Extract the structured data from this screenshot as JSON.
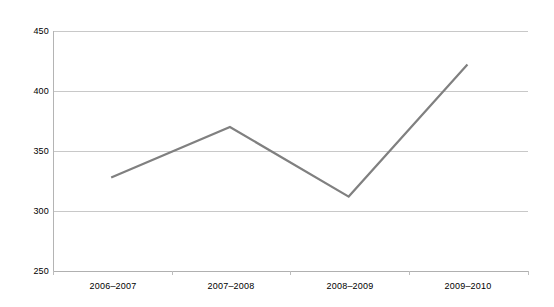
{
  "chart_data": {
    "type": "line",
    "title": "",
    "subtitle": "",
    "xlabel": "",
    "ylabel": "",
    "categories": [
      "2006–2007",
      "2007–2008",
      "2008–2009",
      "2009–2010"
    ],
    "series": [
      {
        "name": "",
        "values": [
          328,
          370,
          312,
          422
        ]
      }
    ],
    "ylim": [
      250,
      450
    ],
    "yticks": [
      250,
      300,
      350,
      400,
      450
    ],
    "ytick_labels": [
      "250",
      "300",
      "350",
      "400",
      "450"
    ],
    "grid": true,
    "grid_axis": "y",
    "legend": false,
    "legend_position": "none",
    "colors": {
      "line": "#808080",
      "gridline": "#c8c8c8",
      "axis": "#b4b4b4",
      "background": "#ffffff",
      "text": "#000000"
    }
  }
}
